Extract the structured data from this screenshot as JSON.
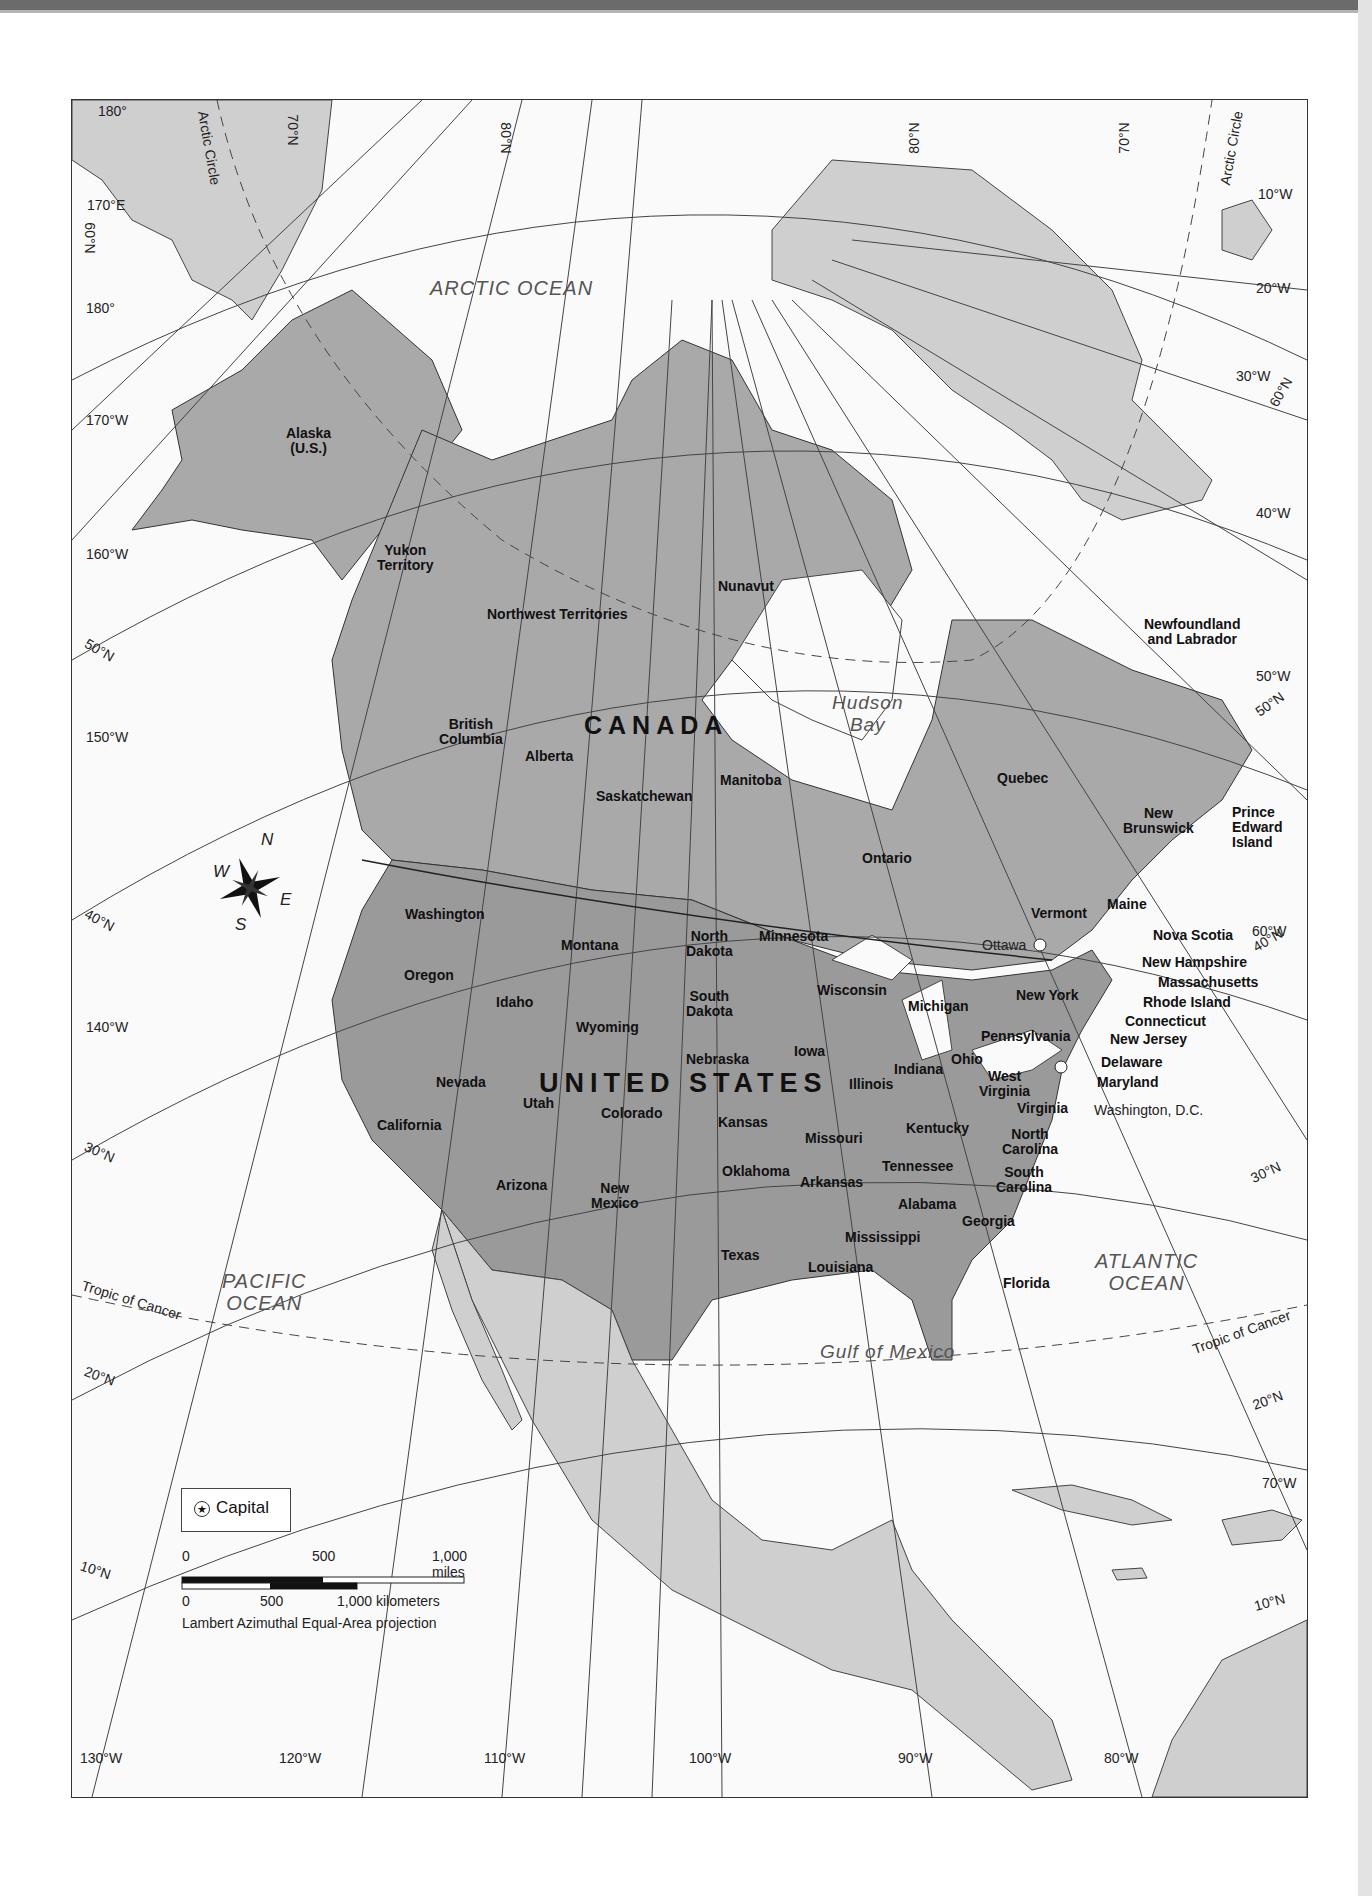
{
  "map": {
    "projection": "Lambert Azimuthal Equal-Area projection",
    "countries": {
      "canada": "CANADA",
      "united_states": "UNITED STATES"
    },
    "oceans": {
      "arctic": "ARCTIC OCEAN",
      "pacific_line1": "PACIFIC",
      "pacific_line2": "OCEAN",
      "atlantic_line1": "ATLANTIC",
      "atlantic_line2": "OCEAN",
      "hudson_line1": "Hudson",
      "hudson_line2": "Bay",
      "gulf": "Gulf of Mexico"
    },
    "canada_regions": {
      "alaska_line1": "Alaska",
      "alaska_line2": "(U.S.)",
      "yukon_line1": "Yukon",
      "yukon_line2": "Territory",
      "nwt": "Northwest Territories",
      "nunavut": "Nunavut",
      "bc_line1": "British",
      "bc_line2": "Columbia",
      "alberta": "Alberta",
      "saskatchewan": "Saskatchewan",
      "manitoba": "Manitoba",
      "ontario": "Ontario",
      "quebec": "Quebec",
      "nfl_line1": "Newfoundland",
      "nfl_line2": "and Labrador",
      "nb_line1": "New",
      "nb_line2": "Brunswick",
      "pei_line1": "Prince",
      "pei_line2": "Edward",
      "pei_line3": "Island",
      "nova_scotia": "Nova Scotia"
    },
    "us_states": {
      "washington": "Washington",
      "oregon": "Oregon",
      "california": "California",
      "nevada": "Nevada",
      "idaho": "Idaho",
      "montana": "Montana",
      "wyoming": "Wyoming",
      "utah": "Utah",
      "colorado": "Colorado",
      "arizona": "Arizona",
      "new_mexico_line1": "New",
      "new_mexico_line2": "Mexico",
      "north_dakota_line1": "North",
      "north_dakota_line2": "Dakota",
      "south_dakota_line1": "South",
      "south_dakota_line2": "Dakota",
      "nebraska": "Nebraska",
      "kansas": "Kansas",
      "oklahoma": "Oklahoma",
      "texas": "Texas",
      "minnesota": "Minnesota",
      "iowa": "Iowa",
      "missouri": "Missouri",
      "arkansas": "Arkansas",
      "louisiana": "Louisiana",
      "wisconsin": "Wisconsin",
      "illinois": "Illinois",
      "michigan": "Michigan",
      "indiana": "Indiana",
      "ohio": "Ohio",
      "kentucky": "Kentucky",
      "tennessee": "Tennessee",
      "mississippi": "Mississippi",
      "alabama": "Alabama",
      "georgia": "Georgia",
      "florida": "Florida",
      "south_carolina_line1": "South",
      "south_carolina_line2": "Carolina",
      "north_carolina_line1": "North",
      "north_carolina_line2": "Carolina",
      "virginia": "Virginia",
      "west_virginia_line1": "West",
      "west_virginia_line2": "Virginia",
      "pennsylvania": "Pennsylvania",
      "new_york": "New York",
      "vermont": "Vermont",
      "maine": "Maine",
      "new_hampshire": "New Hampshire",
      "massachusetts": "Massachusetts",
      "rhode_island": "Rhode Island",
      "connecticut": "Connecticut",
      "new_jersey": "New Jersey",
      "delaware": "Delaware",
      "maryland": "Maryland"
    },
    "capitals": {
      "ottawa": "Ottawa",
      "washington_dc": "Washington, D.C."
    },
    "graticule": {
      "lon_bottom": [
        "130°W",
        "120°W",
        "110°W",
        "100°W",
        "90°W",
        "80°W"
      ],
      "lon_left": [
        "180°",
        "170°E",
        "180°",
        "170°W",
        "160°W",
        "150°W",
        "140°W"
      ],
      "lon_right": [
        "10°W",
        "20°W",
        "30°W",
        "40°W",
        "50°W",
        "60°W",
        "70°W"
      ],
      "lat_left": [
        "60°N",
        "50°N",
        "40°N",
        "30°N",
        "20°N",
        "10°N"
      ],
      "lat_top": [
        "70°N",
        "80°N",
        "80°N",
        "70°N"
      ],
      "lat_right": [
        "60°N",
        "50°N",
        "40°N",
        "30°N",
        "20°N",
        "10°N"
      ],
      "arctic_circle": "Arctic Circle",
      "tropic_of_cancer": "Tropic of Cancer"
    },
    "compass": {
      "n": "N",
      "s": "S",
      "e": "E",
      "w": "W"
    }
  },
  "legend": {
    "capital_symbol": "★",
    "capital_label": "Capital"
  },
  "scale_bar": {
    "miles_0": "0",
    "miles_500": "500",
    "miles_1000": "1,000 miles",
    "km_0": "0",
    "km_500": "500",
    "km_1000": "1,000 kilometers"
  },
  "colors": {
    "us_fill": "#9a9a9a",
    "canada_fill": "#a9a9a9",
    "other_land": "#cfcfcf",
    "water": "#fafafa",
    "lines": "#333333"
  }
}
